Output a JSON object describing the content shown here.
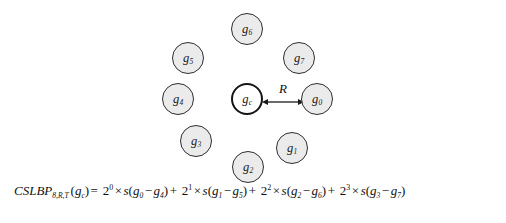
{
  "figure": {
    "type": "cs-lbp-neighborhood-diagram",
    "background_color": "#ffffff",
    "node_fill_color": "#ebebeb",
    "node_border_color": "#2e2e2e",
    "center_node_fill_color": "#ffffff",
    "center_node_border_color": "#151515",
    "arrow_color": "#1a1a1a"
  },
  "diagram": {
    "radius_label": "R",
    "center_node": {
      "label": "g",
      "subscript": "c",
      "name": "g_c",
      "x": 247,
      "y": 99,
      "r": 16
    },
    "nodes": [
      {
        "label": "g",
        "subscript": "0",
        "name": "g_0",
        "x": 317,
        "y": 99,
        "r": 16
      },
      {
        "label": "g",
        "subscript": "1",
        "name": "g_1",
        "x": 292,
        "y": 148,
        "r": 16
      },
      {
        "label": "g",
        "subscript": "2",
        "name": "g_2",
        "x": 248,
        "y": 167,
        "r": 16
      },
      {
        "label": "g",
        "subscript": "3",
        "name": "g_3",
        "x": 196,
        "y": 141,
        "r": 16
      },
      {
        "label": "g",
        "subscript": "4",
        "name": "g_4",
        "x": 178,
        "y": 99,
        "r": 16
      },
      {
        "label": "g",
        "subscript": "5",
        "name": "g_5",
        "x": 188,
        "y": 58,
        "r": 16
      },
      {
        "label": "g",
        "subscript": "6",
        "name": "g_6",
        "x": 247,
        "y": 29,
        "r": 16
      },
      {
        "label": "g",
        "subscript": "7",
        "name": "g_7",
        "x": 299,
        "y": 58,
        "r": 16
      }
    ]
  },
  "formula": {
    "plain_text": "CSLBP(8,R,T)(gc) = 2^0 x s(g0 - g4) + 2^1 x s(g1 - g5) + 2^2 x s(g2 - g6) + 2^3 x s(g3 - g7)",
    "function_name": "CSLBP",
    "function_subscript": "8,R,T",
    "argument": "g",
    "argument_subscript": "c",
    "equals": "=",
    "terms": [
      {
        "base": "2",
        "exponent": "0",
        "times": "×",
        "fn": "s",
        "left": "g",
        "left_sub": "0",
        "minus": "−",
        "right": "g",
        "right_sub": "4",
        "plus": "+"
      },
      {
        "base": "2",
        "exponent": "1",
        "times": "×",
        "fn": "s",
        "left": "g",
        "left_sub": "1",
        "minus": "−",
        "right": "g",
        "right_sub": "5",
        "plus": "+"
      },
      {
        "base": "2",
        "exponent": "2",
        "times": "×",
        "fn": "s",
        "left": "g",
        "left_sub": "2",
        "minus": "−",
        "right": "g",
        "right_sub": "6",
        "plus": "+"
      },
      {
        "base": "2",
        "exponent": "3",
        "times": "×",
        "fn": "s",
        "left": "g",
        "left_sub": "3",
        "minus": "−",
        "right": "g",
        "right_sub": "7",
        "plus": ""
      }
    ]
  }
}
